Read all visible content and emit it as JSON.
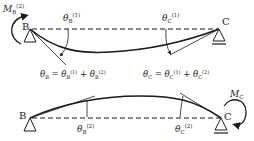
{
  "diagram": {
    "top": {
      "node_left": "B",
      "node_right": "C",
      "moment_label": "M",
      "moment_sub": "B",
      "moment_sup": "(2)",
      "theta_b_label": "θ",
      "theta_b_sub": "B",
      "theta_b_sup": "(1)",
      "theta_c_label": "θ",
      "theta_c_sub": "C",
      "theta_c_sup": "(1)"
    },
    "equations": {
      "left": "θB = θB(1) + θB(2)",
      "right": "θC = θC(1) + θC(2)"
    },
    "bottom": {
      "node_left": "B",
      "node_right": "C",
      "moment_label": "M",
      "moment_sub": "C",
      "theta_b_label": "θ",
      "theta_b_sub": "B",
      "theta_b_sup": "(2)",
      "theta_c_label": "θ",
      "theta_c_sub": "C",
      "theta_c_sup": "(2)"
    },
    "colors": {
      "line": "#1a1a1a",
      "text": "#222222"
    }
  }
}
